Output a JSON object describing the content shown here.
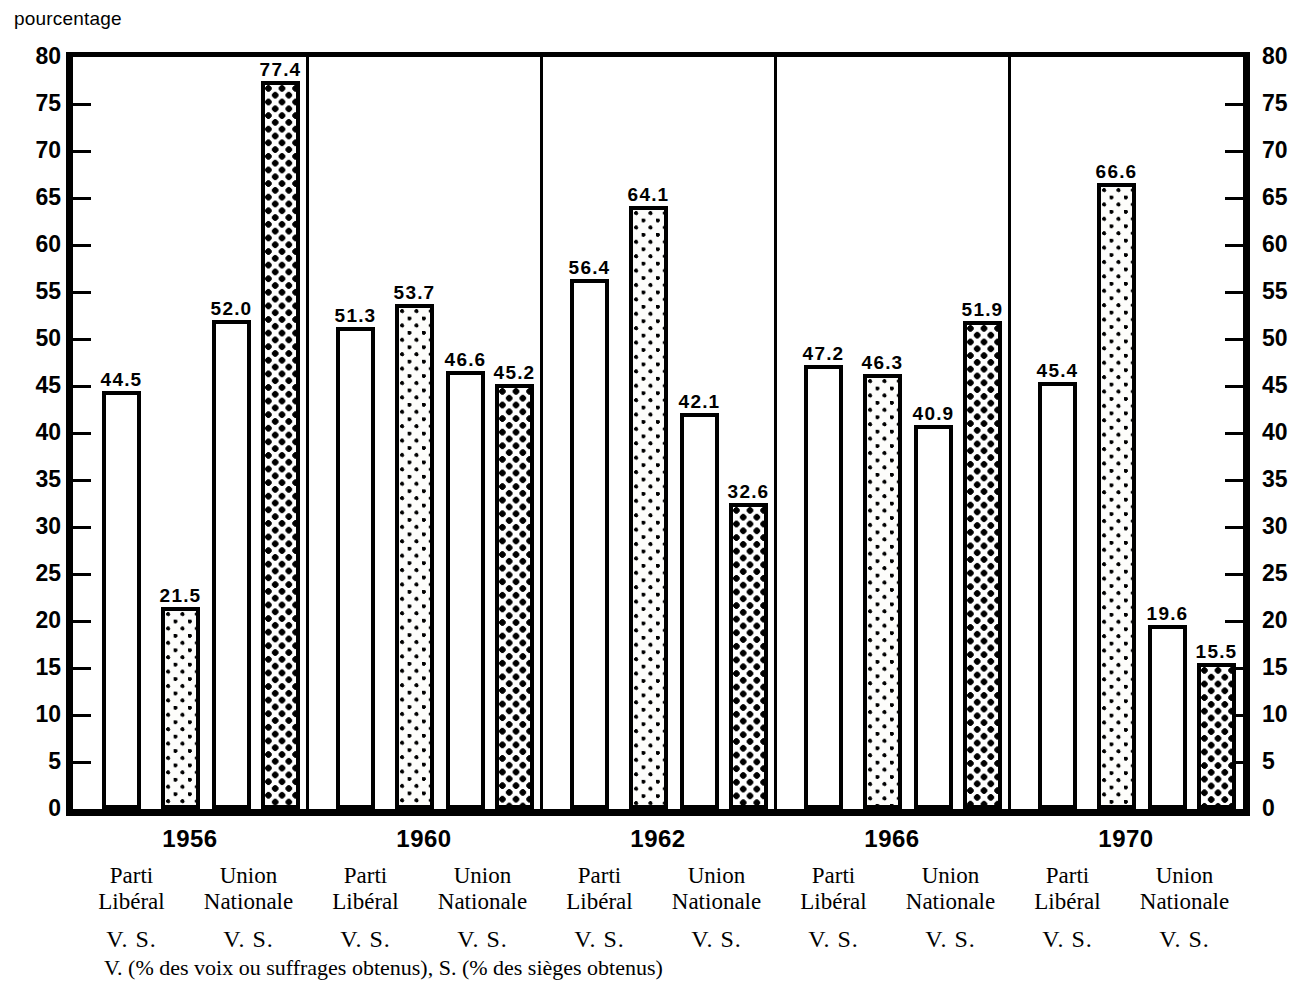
{
  "axis_title": "pourcentage",
  "footnote": "V. (% des voix ou suffrages obtenus), S. (% des sièges obtenus)",
  "legend": {
    "party_liberal_line1": "Parti",
    "party_liberal_line2": "Libéral",
    "party_union_line1": "Union",
    "party_union_line2": "Nationale",
    "vs_label": "V. S."
  },
  "chart_data": {
    "type": "bar",
    "title": "",
    "xlabel": "",
    "ylabel": "pourcentage",
    "ylim": [
      0,
      80
    ],
    "ytick_step": 5,
    "yticks": [
      0,
      5,
      10,
      15,
      20,
      25,
      30,
      35,
      40,
      45,
      50,
      55,
      60,
      65,
      70,
      75,
      80
    ],
    "ytick_labels": [
      "0",
      "5",
      "10",
      "15",
      "20",
      "25",
      "30",
      "35",
      "40",
      "45",
      "50",
      "55",
      "60",
      "65",
      "70",
      "75",
      "80"
    ],
    "grid": false,
    "legend_position": "below-axis",
    "dual_axis": true,
    "categories": [
      "1956",
      "1960",
      "1962",
      "1966",
      "1970"
    ],
    "series": [
      {
        "name": "Parti Libéral V.",
        "pattern": "plain",
        "values": [
          44.5,
          51.3,
          56.4,
          47.2,
          45.4
        ]
      },
      {
        "name": "Parti Libéral S.",
        "pattern": "fine",
        "values": [
          21.5,
          53.7,
          64.1,
          46.3,
          66.6
        ]
      },
      {
        "name": "Union Nationale V.",
        "pattern": "plain",
        "values": [
          52.0,
          46.6,
          42.1,
          40.9,
          19.6
        ]
      },
      {
        "name": "Union Nationale S.",
        "pattern": "dense",
        "values": [
          77.4,
          45.2,
          32.6,
          51.9,
          15.5
        ]
      }
    ],
    "bars": [
      {
        "group": "1956",
        "series": "Parti Libéral V.",
        "label": "44.5",
        "value": 44.5,
        "pattern": "plain"
      },
      {
        "group": "1956",
        "series": "Parti Libéral S.",
        "label": "21.5",
        "value": 21.5,
        "pattern": "fine"
      },
      {
        "group": "1956",
        "series": "Union Nationale V.",
        "label": "52.0",
        "value": 52.0,
        "pattern": "plain"
      },
      {
        "group": "1956",
        "series": "Union Nationale S.",
        "label": "77.4",
        "value": 77.4,
        "pattern": "dense"
      },
      {
        "group": "1960",
        "series": "Parti Libéral V.",
        "label": "51.3",
        "value": 51.3,
        "pattern": "plain"
      },
      {
        "group": "1960",
        "series": "Parti Libéral S.",
        "label": "53.7",
        "value": 53.7,
        "pattern": "fine"
      },
      {
        "group": "1960",
        "series": "Union Nationale V.",
        "label": "46.6",
        "value": 46.6,
        "pattern": "plain"
      },
      {
        "group": "1960",
        "series": "Union Nationale S.",
        "label": "45.2",
        "value": 45.2,
        "pattern": "dense"
      },
      {
        "group": "1962",
        "series": "Parti Libéral V.",
        "label": "56.4",
        "value": 56.4,
        "pattern": "plain"
      },
      {
        "group": "1962",
        "series": "Parti Libéral S.",
        "label": "64.1",
        "value": 64.1,
        "pattern": "fine"
      },
      {
        "group": "1962",
        "series": "Union Nationale V.",
        "label": "42.1",
        "value": 42.1,
        "pattern": "plain"
      },
      {
        "group": "1962",
        "series": "Union Nationale S.",
        "label": "32.6",
        "value": 32.6,
        "pattern": "dense"
      },
      {
        "group": "1966",
        "series": "Parti Libéral V.",
        "label": "47.2",
        "value": 47.2,
        "pattern": "plain"
      },
      {
        "group": "1966",
        "series": "Parti Libéral S.",
        "label": "46.3",
        "value": 46.3,
        "pattern": "fine"
      },
      {
        "group": "1966",
        "series": "Union Nationale V.",
        "label": "40.9",
        "value": 40.9,
        "pattern": "plain"
      },
      {
        "group": "1966",
        "series": "Union Nationale S.",
        "label": "51.9",
        "value": 51.9,
        "pattern": "dense"
      },
      {
        "group": "1970",
        "series": "Parti Libéral V.",
        "label": "45.4",
        "value": 45.4,
        "pattern": "plain"
      },
      {
        "group": "1970",
        "series": "Parti Libéral S.",
        "label": "66.6",
        "value": 66.6,
        "pattern": "fine"
      },
      {
        "group": "1970",
        "series": "Union Nationale V.",
        "label": "19.6",
        "value": 19.6,
        "pattern": "plain"
      },
      {
        "group": "1970",
        "series": "Union Nationale S.",
        "label": "15.5",
        "value": 15.5,
        "pattern": "dense"
      }
    ]
  }
}
